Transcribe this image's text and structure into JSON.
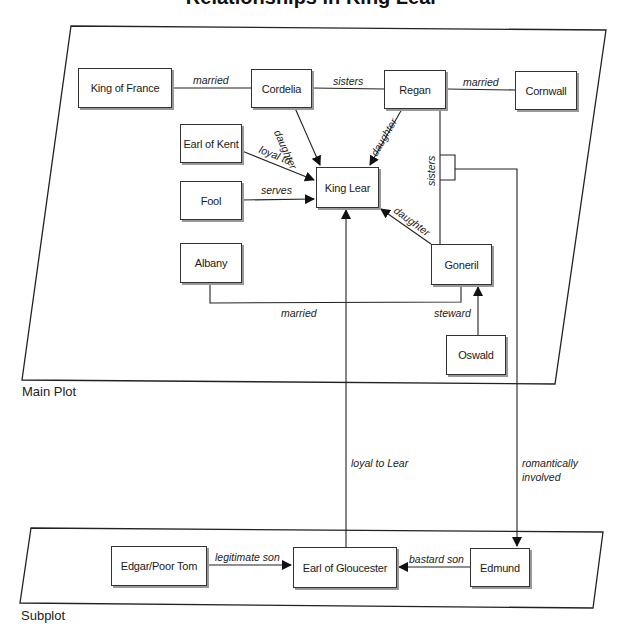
{
  "title": "Relationships in King Lear",
  "regions": {
    "main": {
      "label": "Main Plot"
    },
    "sub": {
      "label": "Subplot"
    }
  },
  "nodes": {
    "king_of_france": "King of France",
    "cordelia": "Cordelia",
    "regan": "Regan",
    "cornwall": "Cornwall",
    "earl_of_kent": "Earl of Kent",
    "fool": "Fool",
    "king_lear": "King Lear",
    "albany": "Albany",
    "goneril": "Goneril",
    "oswald": "Oswald",
    "edgar": "Edgar/Poor Tom",
    "gloucester": "Earl of Gloucester",
    "edmund": "Edmund"
  },
  "edges": {
    "france_cordelia": "married",
    "cordelia_regan": "sisters",
    "regan_cornwall": "married",
    "cordelia_lear": "daughter",
    "regan_lear": "daughter",
    "kent_lear": "loyal to",
    "fool_lear": "serves",
    "goneril_lear": "daughter",
    "regan_goneril": "sisters",
    "albany_goneril": "married",
    "oswald_goneril": "steward",
    "gloucester_lear": "loyal to Lear",
    "goneril_regan_edmund_1": "romantically",
    "goneril_regan_edmund_2": "involved",
    "edgar_gloucester": "legitimate son",
    "edmund_gloucester": "bastard son"
  }
}
